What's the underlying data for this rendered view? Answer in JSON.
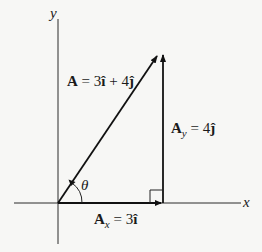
{
  "diagram": {
    "axes": {
      "x_label": "x",
      "y_label": "y"
    },
    "vectors": {
      "A": {
        "name": "A",
        "eq": " = 3",
        "i_hat": "î",
        "plus": " + 4",
        "j_hat": "ĵ"
      },
      "Ay": {
        "name": "A",
        "sub": "y",
        "eq": " = 4",
        "j_hat": "ĵ"
      },
      "Ax": {
        "name": "A",
        "sub": "x",
        "eq": " = 3",
        "i_hat": "î"
      }
    },
    "angle_label": "θ",
    "colors": {
      "background": "#f7f7f5",
      "ink": "#111111"
    }
  }
}
